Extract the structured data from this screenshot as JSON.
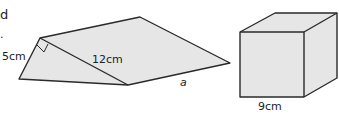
{
  "fragment": {
    "line1": "d",
    "line2": "."
  },
  "prism": {
    "labels": {
      "side": "5cm",
      "hypotenuse": "12cm",
      "length": "a"
    },
    "fill": "#e6e6e6",
    "stroke": "#2a2a2a"
  },
  "cube": {
    "labels": {
      "edge": "9cm"
    },
    "fill": "#e6e6e6",
    "stroke": "#2a2a2a"
  }
}
